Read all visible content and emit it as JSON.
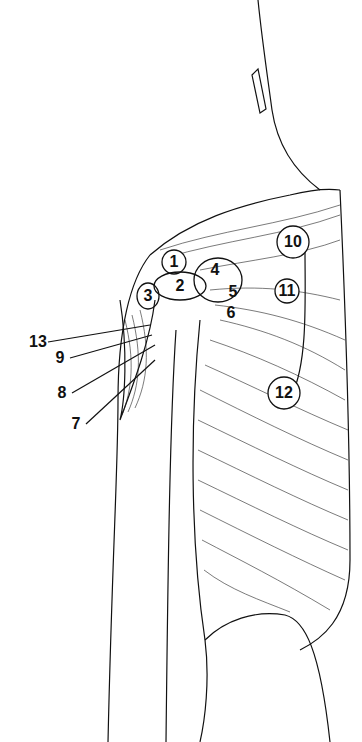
{
  "figure": {
    "labels": [
      {
        "id": "1",
        "x": 174,
        "y": 262,
        "circled": true
      },
      {
        "id": "2",
        "x": 180,
        "y": 286,
        "circled": false
      },
      {
        "id": "3",
        "x": 148,
        "y": 296,
        "circled": false
      },
      {
        "id": "4",
        "x": 215,
        "y": 270,
        "circled": false
      },
      {
        "id": "5",
        "x": 233,
        "y": 292,
        "circled": false
      },
      {
        "id": "6",
        "x": 231,
        "y": 313,
        "circled": false
      },
      {
        "id": "7",
        "x": 76,
        "y": 424,
        "circled": false
      },
      {
        "id": "8",
        "x": 62,
        "y": 393,
        "circled": false
      },
      {
        "id": "9",
        "x": 60,
        "y": 358,
        "circled": false
      },
      {
        "id": "10",
        "x": 293,
        "y": 242,
        "circled": true
      },
      {
        "id": "11",
        "x": 287,
        "y": 291,
        "circled": true
      },
      {
        "id": "12",
        "x": 284,
        "y": 393,
        "circled": true
      },
      {
        "id": "13",
        "x": 38,
        "y": 342,
        "circled": false
      }
    ]
  }
}
